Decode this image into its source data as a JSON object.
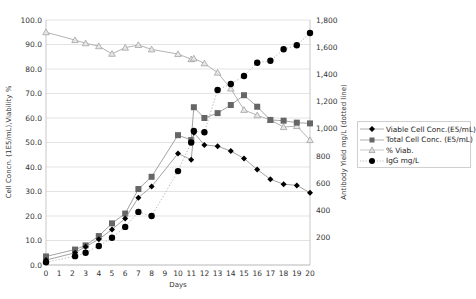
{
  "chart_data": {
    "type": "line",
    "title": "",
    "xlabel": "Days",
    "ylabel": "Cell Concn. (1E5/mL),Viability %",
    "y2label": "Antibody Yield mg/L (dotted line)",
    "xlim": [
      0,
      20
    ],
    "ylim": [
      0,
      100
    ],
    "y2lim": [
      0,
      1800
    ],
    "x_ticks": [
      "0",
      "1",
      "2",
      "3",
      "4",
      "5",
      "6",
      "7",
      "8",
      "9",
      "10",
      "11",
      "12",
      "13",
      "14",
      "15",
      "16",
      "17",
      "18",
      "19",
      "20"
    ],
    "y_ticks": [
      "0.0",
      "10.0",
      "20.0",
      "30.0",
      "40.0",
      "50.0",
      "60.0",
      "70.0",
      "80.0",
      "90.0",
      "100.0"
    ],
    "y2_ticks": [
      "200",
      "400",
      "600",
      "800",
      "1,000",
      "1,200",
      "1,400",
      "1,600",
      "1,800"
    ],
    "grid": "horizontal",
    "legend_position": "right",
    "series": [
      {
        "name": "Viable Cell Conc.(E5/mL)",
        "axis": "left",
        "marker": "diamond",
        "color": "#000000",
        "line_color": "#999999",
        "x": [
          0,
          2.2,
          3,
          4,
          5,
          6,
          7,
          8,
          10,
          11,
          11.2,
          12,
          13,
          14,
          15,
          16,
          17,
          18,
          19,
          20
        ],
        "values": [
          2.0,
          5.0,
          7.5,
          10.5,
          14.5,
          19.0,
          27.5,
          32.0,
          45.5,
          43.0,
          54.0,
          49.0,
          48.5,
          46.5,
          43.5,
          39.0,
          35.0,
          33.0,
          32.5,
          29.5
        ]
      },
      {
        "name": "Total Cell Conc. (E5/mL)",
        "axis": "left",
        "marker": "square",
        "color": "#666666",
        "line_color": "#999999",
        "x": [
          0,
          2.2,
          3,
          4,
          5,
          6,
          7,
          8,
          10,
          11,
          11.2,
          12,
          13,
          14,
          15,
          16,
          17,
          18,
          19,
          20
        ],
        "values": [
          3.5,
          6.3,
          8.0,
          11.8,
          17.0,
          21.0,
          31.0,
          36.0,
          53.0,
          51.0,
          64.4,
          60.0,
          62.0,
          65.3,
          69.3,
          64.6,
          59.2,
          58.9,
          58.1,
          57.8
        ]
      },
      {
        "name": "% Viab.",
        "axis": "left",
        "marker": "triangle",
        "color": "#999999",
        "line_color": "#aaaaaa",
        "x": [
          0,
          2.2,
          3,
          4,
          5,
          6,
          7,
          8,
          10,
          11,
          11.2,
          12,
          13,
          14,
          15,
          16,
          17,
          18,
          19,
          20
        ],
        "values": [
          95.0,
          91.8,
          90.5,
          89.3,
          86.2,
          88.7,
          89.8,
          88.0,
          86.1,
          84.0,
          84.3,
          82.3,
          78.5,
          72.0,
          63.3,
          61.1,
          59.2,
          56.3,
          56.7,
          51.0
        ]
      },
      {
        "name": "IgG mg/L",
        "axis": "right",
        "marker": "circle",
        "color": "#000000",
        "line_color": "#aaaaaa",
        "line_style": "dotted",
        "x": [
          0,
          2.2,
          3,
          4,
          5,
          6,
          7,
          8,
          10,
          11,
          11.2,
          12,
          13,
          14,
          15,
          16,
          17,
          18,
          19,
          20
        ],
        "values": [
          20,
          65,
          90,
          140,
          200,
          280,
          390,
          360,
          690,
          900,
          985,
          975,
          1286,
          1330,
          1389,
          1486,
          1501,
          1585,
          1614,
          1705
        ]
      }
    ]
  },
  "legend": {
    "items": [
      {
        "label": "Viable Cell Conc.(E5/mL)",
        "marker": "diamond-icon"
      },
      {
        "label": "Total Cell Conc. (E5/mL)",
        "marker": "square-icon"
      },
      {
        "label": "% Viab.",
        "marker": "triangle-icon"
      },
      {
        "label": "IgG mg/L",
        "marker": "circle-icon"
      }
    ]
  }
}
